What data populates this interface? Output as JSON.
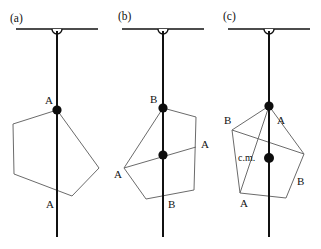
{
  "figure": {
    "background_color": "#ffffff",
    "line_color": "#111111",
    "body_outline_color": "#6b6b6b",
    "dot_color": "#0d0d0d",
    "width": 321,
    "height": 249
  },
  "panels": [
    {
      "id": "a",
      "label": "(a)",
      "label_pos": {
        "x": 10,
        "y": 22
      },
      "ceiling": {
        "x1": 16,
        "y1": 29,
        "x2": 98,
        "y2": 29
      },
      "hook": {
        "cx": 57,
        "cy": 29,
        "r": 5
      },
      "plumb": {
        "x1": 57,
        "y1": 31,
        "x2": 57,
        "y2": 237
      },
      "body_vertices": [
        {
          "x": 57,
          "y": 110
        },
        {
          "x": 99,
          "y": 168
        },
        {
          "x": 72,
          "y": 196
        },
        {
          "x": 14,
          "y": 174
        },
        {
          "x": 13,
          "y": 124
        }
      ],
      "chords": [],
      "dots": [
        {
          "x": 57,
          "y": 110,
          "r": 4.6,
          "name": "suspension-point-a"
        }
      ],
      "vertex_labels": [
        {
          "text": "A",
          "x": 45,
          "y": 104
        },
        {
          "text": "A",
          "x": 46,
          "y": 208
        }
      ],
      "cm_label": null
    },
    {
      "id": "b",
      "label": "(b)",
      "label_pos": {
        "x": 118,
        "y": 20
      },
      "ceiling": {
        "x1": 122,
        "y1": 29,
        "x2": 204,
        "y2": 29
      },
      "hook": {
        "cx": 163,
        "cy": 29,
        "r": 5
      },
      "plumb": {
        "x1": 163,
        "y1": 31,
        "x2": 163,
        "y2": 237
      },
      "body_vertices": [
        {
          "x": 163,
          "y": 108
        },
        {
          "x": 196,
          "y": 117
        },
        {
          "x": 194,
          "y": 190
        },
        {
          "x": 146,
          "y": 199
        },
        {
          "x": 124,
          "y": 168
        }
      ],
      "chords": [
        {
          "x1": 124,
          "y1": 168,
          "x2": 196,
          "y2": 147,
          "name": "chord-a-a"
        },
        {
          "x1": 163,
          "y1": 108,
          "x2": 163,
          "y2": 199,
          "name": "chord-b-b"
        }
      ],
      "dots": [
        {
          "x": 163,
          "y": 108,
          "r": 4.6,
          "name": "suspension-point-b"
        },
        {
          "x": 163,
          "y": 155,
          "r": 4.6,
          "name": "plumb-chord-intersection"
        }
      ],
      "vertex_labels": [
        {
          "text": "B",
          "x": 150,
          "y": 103
        },
        {
          "text": "B",
          "x": 168,
          "y": 208
        },
        {
          "text": "A",
          "x": 114,
          "y": 178
        },
        {
          "text": "A",
          "x": 201,
          "y": 148
        }
      ],
      "cm_label": null
    },
    {
      "id": "c",
      "label": "(c)",
      "label_pos": {
        "x": 223,
        "y": 20
      },
      "ceiling": {
        "x1": 228,
        "y1": 29,
        "x2": 310,
        "y2": 29
      },
      "hook": {
        "cx": 269,
        "cy": 29,
        "r": 5
      },
      "plumb": {
        "x1": 269,
        "y1": 31,
        "x2": 269,
        "y2": 237
      },
      "body_vertices": [
        {
          "x": 269,
          "y": 106
        },
        {
          "x": 304,
          "y": 154
        },
        {
          "x": 286,
          "y": 198
        },
        {
          "x": 240,
          "y": 193
        },
        {
          "x": 232,
          "y": 130
        }
      ],
      "chords": [
        {
          "x1": 232,
          "y1": 130,
          "x2": 304,
          "y2": 154,
          "name": "chord-b-b"
        },
        {
          "x1": 269,
          "y1": 106,
          "x2": 240,
          "y2": 193,
          "name": "chord-a-a"
        },
        {
          "x1": 269,
          "y1": 106,
          "x2": 269,
          "y2": 198,
          "name": "chord-plumb-overlay"
        }
      ],
      "dots": [
        {
          "x": 269,
          "y": 106,
          "r": 4.6,
          "name": "suspension-point-c"
        },
        {
          "x": 269,
          "y": 158,
          "r": 5.0,
          "name": "center-of-mass-point"
        }
      ],
      "vertex_labels": [
        {
          "text": "B",
          "x": 224,
          "y": 124
        },
        {
          "text": "B",
          "x": 297,
          "y": 185
        },
        {
          "text": "A",
          "x": 277,
          "y": 124
        },
        {
          "text": "A",
          "x": 240,
          "y": 207
        }
      ],
      "cm_label": {
        "text": "c.m.",
        "x": 238,
        "y": 161
      }
    }
  ]
}
